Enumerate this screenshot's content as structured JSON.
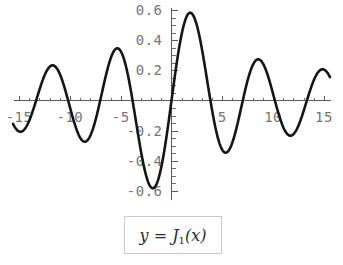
{
  "caption": {
    "y_symbol": "y",
    "equals": "=",
    "function_symbol": "J",
    "order": "1",
    "argument": "(x)",
    "full_text": "y = J1(x)"
  },
  "colors": {
    "curve": "#151515",
    "axis": "#5a5a5a",
    "tick_label": "#767676",
    "caption_border": "#c9c9c9",
    "background": "#ffffff"
  },
  "chart_data": {
    "type": "line",
    "title": "",
    "subtitle": "",
    "xlabel": "",
    "ylabel": "",
    "legend": [],
    "legend_position": "none",
    "grid": false,
    "xlim": [
      -15.6,
      15.6
    ],
    "ylim": [
      -0.65,
      0.65
    ],
    "x_ticks_major": [
      -15,
      -10,
      -5,
      5,
      10,
      15
    ],
    "x_tick_labels": [
      "-15",
      "-10",
      "-5",
      "5",
      "10",
      "15"
    ],
    "x_tick_minor_step": 1,
    "y_ticks_major": [
      0.6,
      0.4,
      0.2,
      -0.2,
      -0.4,
      -0.6
    ],
    "y_tick_labels": [
      "0.6",
      "0.4",
      "0.2",
      "-0.2",
      "-0.4",
      "-0.6"
    ],
    "y_tick_minor_step": 0.05,
    "series": [
      {
        "name": "J1(x)",
        "x": [
          -15.6,
          -15.2,
          -14.8,
          -14.4,
          -14.0,
          -13.6,
          -13.2,
          -12.8,
          -12.4,
          -12.0,
          -11.6,
          -11.2,
          -10.8,
          -10.4,
          -10.0,
          -9.6,
          -9.2,
          -8.8,
          -8.4,
          -8.0,
          -7.6,
          -7.2,
          -6.8,
          -6.4,
          -6.0,
          -5.6,
          -5.2,
          -4.8,
          -4.4,
          -4.0,
          -3.6,
          -3.2,
          -2.8,
          -2.4,
          -2.0,
          -1.6,
          -1.2,
          -0.8,
          -0.4,
          0.0,
          0.4,
          0.8,
          1.2,
          1.6,
          2.0,
          2.4,
          2.8,
          3.2,
          3.6,
          4.0,
          4.4,
          4.8,
          5.2,
          5.6,
          6.0,
          6.4,
          6.8,
          7.2,
          7.6,
          8.0,
          8.4,
          8.8,
          9.2,
          9.6,
          10.0,
          10.4,
          10.8,
          11.2,
          11.6,
          12.0,
          12.4,
          12.8,
          13.2,
          13.6,
          14.0,
          14.4,
          14.8,
          15.2,
          15.6
        ],
        "y": [
          -0.205,
          -0.181,
          -0.146,
          -0.103,
          -0.054,
          -0.003,
          0.048,
          0.096,
          0.139,
          0.174,
          0.199,
          0.212,
          0.213,
          0.202,
          0.043,
          0.159,
          0.12,
          0.072,
          0.019,
          -0.023,
          -0.093,
          -0.151,
          -0.196,
          -0.224,
          -0.277,
          -0.259,
          -0.22,
          -0.298,
          -0.202,
          -0.066,
          0.095,
          0.261,
          0.409,
          0.52,
          0.577,
          0.57,
          0.498,
          0.369,
          0.196,
          0.0,
          -0.196,
          -0.369,
          -0.498,
          -0.57,
          -0.577,
          -0.52,
          -0.409,
          -0.261,
          -0.095,
          0.066,
          0.202,
          0.298,
          0.343,
          0.334,
          0.277,
          0.182,
          0.064,
          -0.058,
          -0.17,
          -0.235,
          -0.271,
          -0.27,
          -0.233,
          -0.168,
          -0.043,
          -0.01,
          0.07,
          0.139,
          0.189,
          0.213,
          0.209,
          0.178,
          0.124,
          0.053,
          -0.023,
          -0.098,
          -0.161,
          -0.203,
          -0.218
        ],
        "peaks": [
          {
            "x": -11.7,
            "y": 0.219
          },
          {
            "x": -5.3,
            "y": 0.374
          },
          {
            "x": 1.84,
            "y": 0.581
          },
          {
            "x": 8.5,
            "y": 0.273
          },
          {
            "x": 15.0,
            "y": 0.215
          }
        ],
        "troughs": [
          {
            "x": -15.0,
            "y": -0.205
          },
          {
            "x": -8.5,
            "y": -0.273
          },
          {
            "x": -1.84,
            "y": -0.581
          },
          {
            "x": 5.3,
            "y": -0.346
          },
          {
            "x": 11.7,
            "y": -0.232
          }
        ],
        "zeros": [
          -13.32,
          -10.17,
          -7.02,
          -3.83,
          0.0,
          3.83,
          7.02,
          10.17,
          13.32
        ]
      }
    ]
  }
}
